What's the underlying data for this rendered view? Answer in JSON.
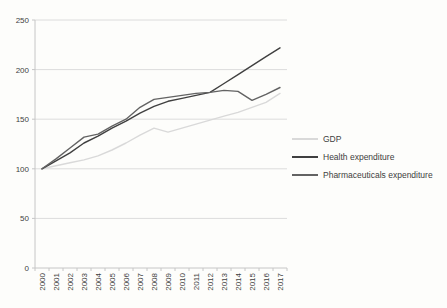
{
  "chart_data": {
    "type": "line",
    "title": "",
    "xlabel": "",
    "ylabel": "",
    "categories": [
      "2000",
      "2001",
      "2002",
      "2003",
      "2004",
      "2005",
      "2006",
      "2007",
      "2008",
      "2009",
      "2010",
      "2011",
      "2012",
      "2013",
      "2014",
      "2015",
      "2016",
      "2017"
    ],
    "series": [
      {
        "name": "GDP",
        "color": "#d9d9d9",
        "values": [
          100,
          103,
          106,
          109,
          113,
          119,
          126,
          134,
          141,
          137,
          141,
          145,
          149,
          153,
          157,
          162,
          167,
          176
        ]
      },
      {
        "name": "Health expenditure",
        "color": "#404040",
        "values": [
          100,
          108,
          116,
          126,
          133,
          141,
          148,
          156,
          163,
          168,
          171,
          174,
          177,
          186,
          195,
          204,
          213,
          222
        ]
      },
      {
        "name": "Pharmaceuticals expenditure",
        "color": "#636363",
        "values": [
          100,
          110,
          121,
          132,
          135,
          143,
          150,
          162,
          170,
          172,
          174,
          176,
          177,
          179,
          178,
          169,
          175,
          182
        ]
      }
    ],
    "ylim": [
      0,
      250
    ],
    "y_ticks": [
      0,
      50,
      100,
      150,
      200,
      250
    ],
    "grid": "horizontal-only",
    "legend_position": "right-middle",
    "index_note": "index 2000 = 100",
    "axis_color": "#c6c6c6",
    "gridline_color": "#dcdcdc",
    "tick_label_color": "#3f3f3f"
  }
}
